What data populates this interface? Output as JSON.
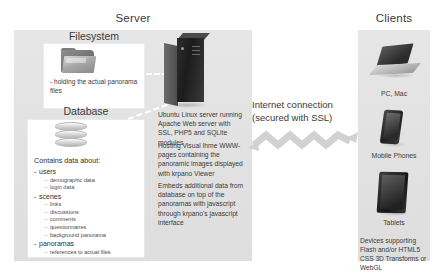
{
  "server": {
    "title": "Server",
    "filesystem": {
      "label": "Filesystem",
      "icon": "folder-icon",
      "note": "- holding the actual panorama files"
    },
    "database": {
      "label": "Database",
      "icon": "database-cylinder-icon",
      "heading": "Contains data about:",
      "items": [
        {
          "label": "users",
          "children": [
            "demographic data",
            "login data"
          ]
        },
        {
          "label": "scenes",
          "children": [
            "links",
            "discussions",
            "comments",
            "questionnaires",
            "background panorama"
          ]
        },
        {
          "label": "panoramas",
          "children": [
            "references to actual files"
          ]
        }
      ]
    },
    "tower_icon": "server-tower-icon",
    "descriptions": [
      "Ubuntu Linux server running Apache Web server with SSL, PHP5 and SQLite modules",
      "Hosting Visual Ihme WWW-pages containing the panoramic images displayed with krpano Viewer",
      "Embeds additional data from database on top of the panoramas with javascript through krpano's javascript interface"
    ]
  },
  "connection": {
    "label": "Internet connection (secured with SSL)",
    "icon": "zigzag-double-arrow-icon"
  },
  "clients": {
    "title": "Clients",
    "devices": [
      {
        "label": "PC, Mac",
        "icon": "laptop-icon"
      },
      {
        "label": "Mobile Phones",
        "icon": "mobile-phone-icon"
      },
      {
        "label": "Tablets",
        "icon": "tablet-icon"
      }
    ],
    "note": "Devices supporting Flash and/or HTML5 CSS 3D Transforms or WebGL"
  },
  "colors": {
    "panel": "#e3e3e3",
    "card": "#ffffff",
    "text": "#3a3a3a",
    "device": "#2c2c2c"
  }
}
